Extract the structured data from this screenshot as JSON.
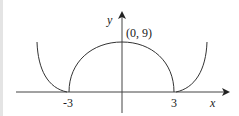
{
  "diagram": {
    "type": "function-graph",
    "axes": {
      "x_label": "x",
      "y_label": "y"
    },
    "labels": {
      "peak": "(0, 9)",
      "x_neg": "-3",
      "x_pos": "3"
    },
    "curves": [
      {
        "name": "left-branch",
        "description": "curve descending to tangent point at x = -3",
        "domain": "x ≤ -3"
      },
      {
        "name": "semicircle-arc",
        "description": "arc from (-3, 0) through (0, 9) to (3, 0)",
        "domain": "-3 ≤ x ≤ 3"
      },
      {
        "name": "right-branch",
        "description": "curve rising from tangent point at x = 3",
        "domain": "x ≥ 3"
      }
    ],
    "colors": {
      "stroke": "#333333",
      "background": "#ffffff"
    }
  }
}
